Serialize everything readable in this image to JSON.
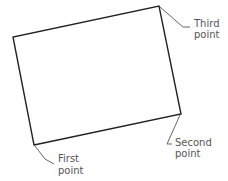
{
  "diagram": {
    "shape": "rotated rectangle",
    "corners": {
      "first": [
        34,
        145
      ],
      "second": [
        181,
        114
      ],
      "third": [
        159,
        6
      ],
      "fourth": [
        13,
        37
      ]
    },
    "labels": {
      "first": [
        "First",
        "point"
      ],
      "second": [
        "Second",
        "point"
      ],
      "third": [
        "Third",
        "point"
      ]
    },
    "colors": {
      "rect_stroke": "#222222",
      "leader_stroke": "#666666",
      "label_text": "#555555"
    }
  }
}
